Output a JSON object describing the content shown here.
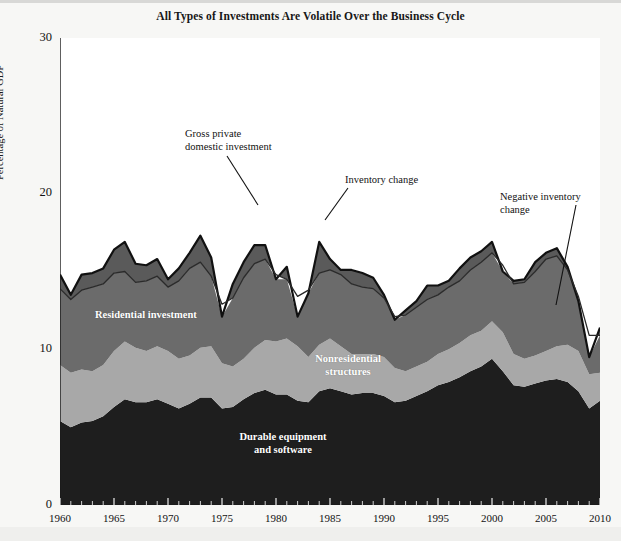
{
  "figure": {
    "title": "All Types of Investments Are Volatile Over the Business Cycle",
    "background": "#f7f7f5"
  },
  "axes": {
    "ylabel": "Percentage of Natural GDP",
    "yticks": [
      "0",
      "10",
      "20",
      "30"
    ],
    "xticks": [
      "1960",
      "1965",
      "1970",
      "1975",
      "1980",
      "1985",
      "1990",
      "1995",
      "2000",
      "2005",
      "2010"
    ]
  },
  "annotations": [
    {
      "name": "gross-private-domestic-investment",
      "text": "Gross private\ndomestic investment"
    },
    {
      "name": "inventory-change",
      "text": "Inventory change"
    },
    {
      "name": "negative-inventory-change",
      "text": "Negative inventory\nchange"
    }
  ],
  "band_labels": [
    {
      "name": "residential-investment",
      "text": "Residential investment"
    },
    {
      "name": "nonresidential-structures",
      "text": "Nonresidential\nstructures"
    },
    {
      "name": "durable-equipment-and-software",
      "text": "Durable equipment\nand software"
    }
  ],
  "colors": {
    "durable_equipment": "#1e1e1e",
    "nonresidential_structures": "#a8a8a8",
    "residential_investment": "#6b6b6b",
    "inventory_change": "#5a5a5a",
    "total_outline": "#111111",
    "plot_background": "#ffffff",
    "text": "#121212"
  },
  "chart_data": {
    "type": "area",
    "stacked": true,
    "title": "All Types of Investments Are Volatile Over the Business Cycle",
    "xlabel": "",
    "ylabel": "Percentage of Natural GDP",
    "xlim": [
      1960,
      2010
    ],
    "ylim": [
      0,
      30
    ],
    "grid": false,
    "legend": "in-plot labels",
    "x": [
      1960,
      1961,
      1962,
      1963,
      1964,
      1965,
      1966,
      1967,
      1968,
      1969,
      1970,
      1971,
      1972,
      1973,
      1974,
      1975,
      1976,
      1977,
      1978,
      1979,
      1980,
      1981,
      1982,
      1983,
      1984,
      1985,
      1986,
      1987,
      1988,
      1989,
      1990,
      1991,
      1992,
      1993,
      1994,
      1995,
      1996,
      1997,
      1998,
      1999,
      2000,
      2001,
      2002,
      2003,
      2004,
      2005,
      2006,
      2007,
      2008,
      2009,
      2010
    ],
    "series": [
      {
        "name": "Durable equipment and software",
        "color": "#1e1e1e",
        "values": [
          5.4,
          5.0,
          5.3,
          5.4,
          5.7,
          6.3,
          6.8,
          6.6,
          6.6,
          6.8,
          6.5,
          6.2,
          6.5,
          6.9,
          6.9,
          6.2,
          6.3,
          6.8,
          7.2,
          7.4,
          7.1,
          7.1,
          6.7,
          6.6,
          7.3,
          7.5,
          7.3,
          7.1,
          7.2,
          7.2,
          7.0,
          6.6,
          6.7,
          7.0,
          7.3,
          7.7,
          7.9,
          8.2,
          8.6,
          8.9,
          9.4,
          8.6,
          7.7,
          7.6,
          7.8,
          8.0,
          8.1,
          7.9,
          7.3,
          6.2,
          6.7
        ]
      },
      {
        "name": "Nonresidential structures",
        "color": "#a8a8a8",
        "values": [
          3.6,
          3.5,
          3.4,
          3.2,
          3.3,
          3.6,
          3.7,
          3.5,
          3.3,
          3.4,
          3.4,
          3.2,
          3.1,
          3.2,
          3.3,
          2.9,
          2.6,
          2.6,
          2.9,
          3.2,
          3.4,
          3.6,
          3.5,
          2.9,
          3.0,
          3.2,
          2.9,
          2.6,
          2.5,
          2.5,
          2.5,
          2.2,
          1.9,
          1.9,
          1.9,
          2.0,
          2.1,
          2.2,
          2.3,
          2.3,
          2.4,
          2.5,
          2.0,
          1.8,
          1.8,
          1.9,
          2.1,
          2.4,
          2.6,
          2.2,
          1.8
        ]
      },
      {
        "name": "Residential investment",
        "color": "#6b6b6b",
        "values": [
          4.9,
          4.7,
          5.1,
          5.4,
          5.2,
          5.0,
          4.5,
          4.2,
          4.5,
          4.5,
          4.1,
          5.0,
          5.6,
          5.5,
          4.5,
          3.8,
          4.4,
          5.2,
          5.4,
          5.2,
          4.3,
          3.8,
          3.2,
          4.3,
          4.6,
          4.4,
          4.6,
          4.5,
          4.3,
          4.2,
          3.8,
          3.3,
          3.6,
          3.8,
          4.0,
          3.8,
          4.0,
          4.0,
          4.2,
          4.4,
          4.4,
          4.3,
          4.5,
          4.9,
          5.4,
          5.9,
          5.8,
          4.8,
          3.5,
          2.5,
          2.4
        ]
      },
      {
        "name": "Inventory change",
        "color": "#5a5a5a",
        "values": [
          0.9,
          0.3,
          1.0,
          0.9,
          1.0,
          1.5,
          1.9,
          1.2,
          1.0,
          1.1,
          0.5,
          0.8,
          1.0,
          1.7,
          1.2,
          -0.8,
          0.9,
          1.0,
          1.2,
          0.9,
          -0.3,
          0.8,
          -1.3,
          -0.2,
          2.0,
          0.7,
          0.3,
          0.9,
          0.9,
          0.7,
          0.2,
          -0.2,
          0.3,
          0.4,
          0.9,
          0.6,
          0.4,
          0.8,
          0.8,
          0.7,
          0.7,
          -0.4,
          0.2,
          0.2,
          0.6,
          0.4,
          0.5,
          0.2,
          -0.3,
          -1.4,
          0.5
        ]
      }
    ],
    "total_line": {
      "name": "Gross private domestic investment",
      "color": "#111111",
      "values": [
        14.8,
        13.5,
        14.8,
        14.9,
        15.2,
        16.4,
        16.9,
        15.5,
        15.4,
        15.8,
        14.5,
        15.2,
        16.2,
        17.3,
        15.9,
        12.1,
        14.2,
        15.6,
        16.7,
        16.7,
        14.5,
        15.3,
        12.1,
        13.6,
        16.9,
        15.8,
        15.1,
        15.1,
        14.9,
        14.6,
        13.5,
        11.9,
        12.5,
        13.1,
        14.1,
        14.1,
        14.4,
        15.2,
        15.9,
        16.3,
        16.9,
        15.0,
        14.4,
        14.5,
        15.6,
        16.2,
        16.5,
        15.3,
        13.1,
        9.5,
        11.4
      ]
    },
    "notes": [
      "Peak of about 20% of natural GDP in 1978-1979 and again near 2000 and 2006.",
      "Troughs at recessions: 1975, 1982, 1991, 2009.",
      "Negative inventory change produces dips below the total line, notably 1975, 1982, 2009."
    ]
  }
}
